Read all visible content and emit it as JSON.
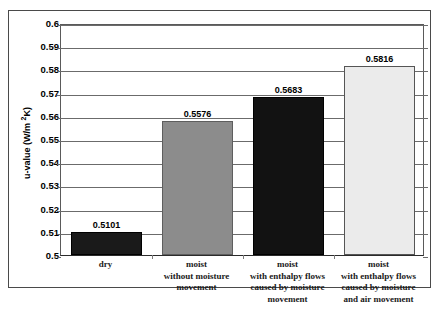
{
  "chart_data": {
    "type": "bar",
    "title": "",
    "subtitle": "",
    "xlabel": "",
    "ylabel": "u-value (W/m 2K)",
    "ylabel_main": "u-value (W/m ",
    "ylabel_sup": "2",
    "ylabel_tail": "K)",
    "categories": [
      "dry",
      "moist\nwithout moisture\nmovement",
      "moist\nwith enthalpy flows\ncaused by moisture\nmovement",
      "moist\nwith enthalpy flows\ncaused by moisture\nand air movement"
    ],
    "category_lines": [
      [
        "dry"
      ],
      [
        "moist",
        "without moisture",
        "movement"
      ],
      [
        "moist",
        "with enthalpy flows",
        "caused by moisture",
        "movement"
      ],
      [
        "moist",
        "with enthalpy flows",
        "caused by moisture",
        "and air movement"
      ]
    ],
    "values": [
      0.5101,
      0.5576,
      0.5683,
      0.5816
    ],
    "value_labels": [
      "0.5101",
      "0.5576",
      "0.5683",
      "0.5816"
    ],
    "bar_colors": [
      "#1a1a1a",
      "#8c8c8c",
      "#121212",
      "#ebebeb"
    ],
    "bar_border_colors": [
      "#000000",
      "#5e5e5e",
      "#000000",
      "#555555"
    ],
    "ylim": [
      0.5,
      0.6
    ],
    "ytick_values": [
      0.5,
      0.51,
      0.52,
      0.53,
      0.54,
      0.55,
      0.56,
      0.57,
      0.58,
      0.59,
      0.6
    ],
    "ytick_labels": [
      "0.5",
      "0.51",
      "0.52",
      "0.53",
      "0.54",
      "0.55",
      "0.56",
      "0.57",
      "0.58",
      "0.59",
      "0.6"
    ],
    "grid": true,
    "grid_axis": "y",
    "legend": false,
    "legend_position": "none",
    "background_color": "#ffffff",
    "frame_color": "#4a4a4a"
  }
}
